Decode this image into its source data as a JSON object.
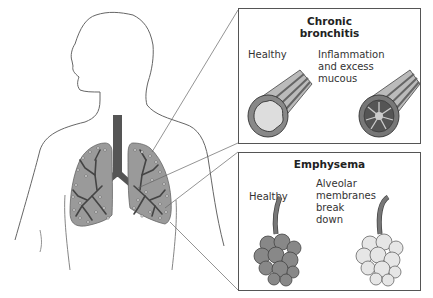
{
  "diagram": {
    "panels": [
      {
        "title_line1": "Chronic",
        "title_line2": "bronchitis",
        "left_label": "Healthy",
        "right_label_1": "Inflammation",
        "right_label_2": "and excess",
        "right_label_3": "mucous"
      },
      {
        "title": "Emphysema",
        "left_label": "Healthy",
        "right_label_1": "Alveolar",
        "right_label_2": "membranes",
        "right_label_3": "break",
        "right_label_4": "down"
      }
    ],
    "colors": {
      "lung_fill": "#9a9a9a",
      "airway": "#555555",
      "outline": "#555555",
      "background": "#ffffff"
    }
  }
}
